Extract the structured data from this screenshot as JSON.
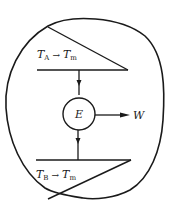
{
  "diagram": {
    "type": "heat-engine-between-finite-reservoirs",
    "top_reservoir": {
      "label_main": "T",
      "label_sub": "A",
      "arrow": "→",
      "label2_main": "T",
      "label2_sub": "m"
    },
    "bottom_reservoir": {
      "label_main": "T",
      "label_sub": "B",
      "arrow": "→",
      "label2_main": "T",
      "label2_sub": "m"
    },
    "engine": {
      "label": "E"
    },
    "work_output": {
      "label": "W"
    },
    "colors": {
      "stroke": "#1a1a1a",
      "background": "#ffffff"
    }
  }
}
